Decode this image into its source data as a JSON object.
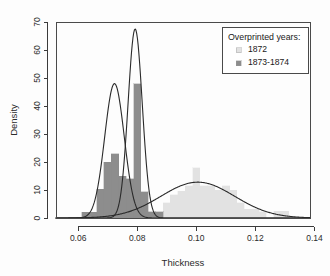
{
  "chart_data": {
    "type": "bar",
    "title": "",
    "xlabel": "Thickness",
    "ylabel": "Density",
    "xlim": [
      0.0525,
      0.1385
    ],
    "ylim": [
      0,
      70
    ],
    "xticks": [
      0.06,
      0.08,
      0.1,
      0.12,
      0.14
    ],
    "xtick_labels": [
      "0.06",
      "0.08",
      "0.10",
      "0.12",
      "0.14"
    ],
    "yticks": [
      0,
      10,
      20,
      30,
      40,
      50,
      60,
      70
    ],
    "ytick_labels": [
      "0",
      "10",
      "20",
      "30",
      "40",
      "50",
      "60",
      "70"
    ],
    "grid": false,
    "bin_width": 0.0025,
    "legend": {
      "position": "top-right",
      "title": "Overprinted years:",
      "entries": [
        {
          "label": "1872",
          "color": "#e2e2e2"
        },
        {
          "label": "1873-1874",
          "color": "#8d8d8d"
        }
      ]
    },
    "series": [
      {
        "name": "1872",
        "color": "#e2e2e2",
        "kind": "histogram",
        "bins": [
          {
            "x": 0.0875,
            "value": 0.0
          },
          {
            "x": 0.09,
            "value": 5.4
          },
          {
            "x": 0.0925,
            "value": 8.3
          },
          {
            "x": 0.095,
            "value": 9.6
          },
          {
            "x": 0.0975,
            "value": 11.6
          },
          {
            "x": 0.1,
            "value": 18.0
          },
          {
            "x": 0.1025,
            "value": 11.6
          },
          {
            "x": 0.105,
            "value": 11.6
          },
          {
            "x": 0.1075,
            "value": 10.0
          },
          {
            "x": 0.11,
            "value": 11.6
          },
          {
            "x": 0.1125,
            "value": 10.0
          },
          {
            "x": 0.115,
            "value": 5.4
          },
          {
            "x": 0.1175,
            "value": 3.2
          },
          {
            "x": 0.12,
            "value": 3.2
          },
          {
            "x": 0.1225,
            "value": 2.2
          },
          {
            "x": 0.125,
            "value": 0.0
          },
          {
            "x": 0.1275,
            "value": 2.4
          },
          {
            "x": 0.13,
            "value": 2.4
          }
        ]
      },
      {
        "name": "1873-1874",
        "color": "#8d8d8d",
        "kind": "histogram",
        "bins": [
          {
            "x": 0.0625,
            "value": 2.0
          },
          {
            "x": 0.065,
            "value": 2.0
          },
          {
            "x": 0.0675,
            "value": 10.3
          },
          {
            "x": 0.07,
            "value": 20.0
          },
          {
            "x": 0.0725,
            "value": 23.0
          },
          {
            "x": 0.075,
            "value": 15.0
          },
          {
            "x": 0.0775,
            "value": 14.0
          },
          {
            "x": 0.08,
            "value": 48.0
          },
          {
            "x": 0.0825,
            "value": 9.4
          },
          {
            "x": 0.085,
            "value": 2.2
          },
          {
            "x": 0.0875,
            "value": 2.2
          }
        ]
      }
    ],
    "curves": [
      {
        "name": "component-1873-1874-mode-a",
        "kind": "normal-density",
        "color": "#2a2a2a",
        "mean": 0.0723,
        "sd": 0.0033,
        "peak": 48.0
      },
      {
        "name": "component-1873-1874-mode-b",
        "kind": "normal-density",
        "color": "#2a2a2a",
        "mean": 0.0793,
        "sd": 0.0024,
        "peak": 67.5
      },
      {
        "name": "component-1872",
        "kind": "normal-density",
        "color": "#2a2a2a",
        "mean": 0.1005,
        "sd": 0.0125,
        "peak": 12.8
      }
    ]
  }
}
